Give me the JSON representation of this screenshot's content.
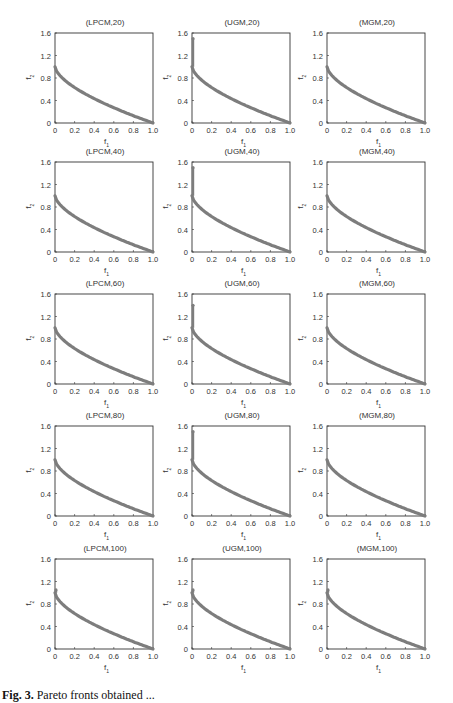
{
  "chart_data": {
    "type": "scatter",
    "layout": "5x3 grid of small multiples",
    "xlabel": "f1",
    "ylabel": "f2",
    "xlim": [
      0,
      1.0
    ],
    "ylim": [
      0,
      1.6
    ],
    "xticks": [
      "0",
      "0.2",
      "0.4",
      "0.6",
      "0.8",
      "1.0"
    ],
    "yticks": [
      "0",
      "0.4",
      "0.8",
      "1.2",
      "1.6"
    ],
    "grid": false,
    "curve_description": "Pareto front points approximately f2 = 1 - sqrt(f1)^... convex decreasing from (0,~1.0) to (1.0,0)",
    "front_points": [
      [
        0,
        1.0
      ],
      [
        0.02,
        0.88
      ],
      [
        0.05,
        0.8
      ],
      [
        0.1,
        0.72
      ],
      [
        0.2,
        0.6
      ],
      [
        0.3,
        0.5
      ],
      [
        0.4,
        0.41
      ],
      [
        0.5,
        0.33
      ],
      [
        0.6,
        0.25
      ],
      [
        0.7,
        0.18
      ],
      [
        0.8,
        0.11
      ],
      [
        0.9,
        0.05
      ],
      [
        1.0,
        0.0
      ]
    ],
    "panels": [
      {
        "title": "(LPCM,20)",
        "max_f2_at_f1_0": 1.0
      },
      {
        "title": "(UGM,20)",
        "max_f2_at_f1_0": 1.5
      },
      {
        "title": "(MGM,20)",
        "max_f2_at_f1_0": 1.0
      },
      {
        "title": "(LPCM,40)",
        "max_f2_at_f1_0": 1.0
      },
      {
        "title": "(UGM,40)",
        "max_f2_at_f1_0": 1.5
      },
      {
        "title": "(MGM,40)",
        "max_f2_at_f1_0": 1.0
      },
      {
        "title": "(LPCM,60)",
        "max_f2_at_f1_0": 1.0
      },
      {
        "title": "(UGM,60)",
        "max_f2_at_f1_0": 1.4
      },
      {
        "title": "(MGM,60)",
        "max_f2_at_f1_0": 1.0
      },
      {
        "title": "(LPCM,80)",
        "max_f2_at_f1_0": 1.0
      },
      {
        "title": "(UGM,80)",
        "max_f2_at_f1_0": 1.5
      },
      {
        "title": "(MGM,80)",
        "max_f2_at_f1_0": 1.0
      },
      {
        "title": "(LPCM,100)",
        "max_f2_at_f1_0": 1.05
      },
      {
        "title": "(UGM,100)",
        "max_f2_at_f1_0": 1.05
      },
      {
        "title": "(MGM,100)",
        "max_f2_at_f1_0": 1.05
      }
    ]
  },
  "labels": {
    "x": "f",
    "x_sub": "1",
    "y": "f",
    "y_sub": "2"
  },
  "colors": {
    "curve": "#7d7d7d",
    "axis": "#333333"
  },
  "caption": {
    "prefix": "Fig. 3.",
    "text": "Pareto fronts obtained ..."
  }
}
